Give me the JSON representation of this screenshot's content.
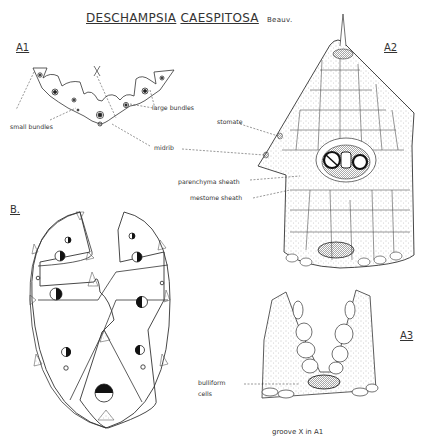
{
  "plate": {
    "title_genus": "DESCHAMPSIA",
    "title_species": "CAESPITOSA",
    "title_author": "Beauv."
  },
  "figures": {
    "a1": {
      "label": "A1",
      "groove_mark": "X",
      "annotations": [
        "small bundles",
        "large bundles",
        "midrib"
      ]
    },
    "a2": {
      "label": "A2",
      "annotations": [
        "stomate",
        "parenchyma sheath",
        "mestome sheath"
      ]
    },
    "b": {
      "label": "B."
    },
    "a3": {
      "label": "A3",
      "annotations": [
        "bulliform",
        "cells"
      ],
      "caption": "groove X in A1"
    }
  },
  "colors": {
    "ink": "#222222",
    "stipple": "#9a9a9a",
    "paper": "#ffffff"
  }
}
